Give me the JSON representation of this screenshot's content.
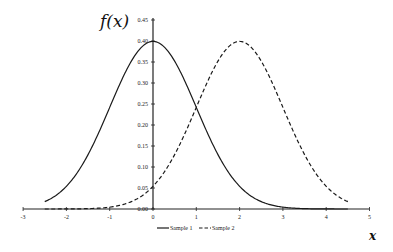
{
  "chart_data": {
    "type": "line",
    "title": "",
    "xlabel": "x",
    "ylabel": "f(x)",
    "xlim": [
      -3,
      5
    ],
    "ylim": [
      0,
      0.45
    ],
    "grid": false,
    "legend_position": "bottom-center",
    "x_ticks": [
      "-3",
      "-2",
      "-1",
      "0",
      "1",
      "2",
      "3",
      "4",
      "5"
    ],
    "y_ticks": [
      "0.00",
      "0.05",
      "0.10",
      "0.15",
      "0.20",
      "0.25",
      "0.30",
      "0.35",
      "0.40",
      "0.45"
    ],
    "x": [
      -2.5,
      -2.0,
      -1.5,
      -1.0,
      -0.5,
      0.0,
      0.5,
      1.0,
      1.5,
      2.0,
      2.5,
      3.0,
      3.5,
      4.0,
      4.5
    ],
    "series": [
      {
        "name": "Sample 1",
        "style": "solid",
        "distribution": "Normal(mean=0, sd=1)",
        "values": [
          0.018,
          0.054,
          0.13,
          0.242,
          0.352,
          0.399,
          0.352,
          0.242,
          0.13,
          0.054,
          0.018,
          0.004,
          0.001,
          0.0,
          0.0
        ]
      },
      {
        "name": "Sample 2",
        "style": "dashed",
        "distribution": "Normal(mean=2, sd=1)",
        "values": [
          0.0,
          0.0,
          0.001,
          0.004,
          0.018,
          0.054,
          0.13,
          0.242,
          0.352,
          0.399,
          0.352,
          0.242,
          0.13,
          0.054,
          0.018
        ]
      }
    ]
  },
  "axes": {
    "y_title": "f(x)",
    "x_title": "x"
  },
  "legend": {
    "items": [
      {
        "label": "Sample 1",
        "style": "solid"
      },
      {
        "label": "Sample 2",
        "style": "dashed"
      }
    ]
  },
  "colors": {
    "line": "#1a1a1a",
    "axis": "#222222"
  }
}
